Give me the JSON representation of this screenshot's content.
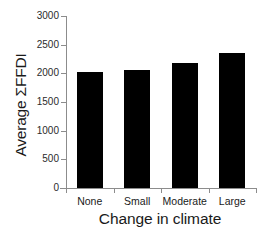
{
  "chart_data": {
    "type": "bar",
    "title": "",
    "xlabel": "Change in climate",
    "ylabel": "Average ΣFFDI",
    "categories": [
      "None",
      "Small",
      "Moderate",
      "Large"
    ],
    "values": [
      2015,
      2060,
      2180,
      2350
    ],
    "ylim": [
      0,
      3000
    ],
    "yticks": [
      0,
      500,
      1000,
      1500,
      2000,
      2500,
      3000
    ],
    "ytick_labels": [
      "0",
      "500",
      "1000",
      "1500",
      "2000",
      "2500",
      "3000"
    ],
    "grid": false,
    "legend": null,
    "bar_color": "#000000",
    "axis_color": "#8c8c8c",
    "background": "#ffffff",
    "series": [
      {
        "name": "Average ΣFFDI",
        "values": [
          2015,
          2060,
          2180,
          2350
        ]
      }
    ]
  }
}
